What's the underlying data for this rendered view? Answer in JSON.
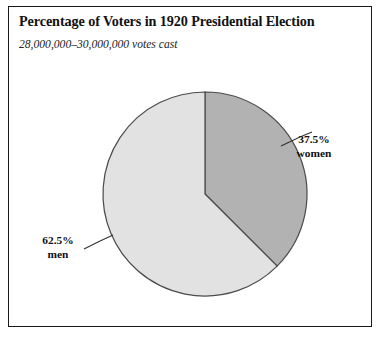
{
  "figure": {
    "title": "Percentage of Voters in 1920 Presidential Election",
    "subtitle": "28,000,000–30,000,000 votes cast",
    "frame_color": "#1a1a1a",
    "background_color": "#ffffff"
  },
  "labels": {
    "women": {
      "percent": "37.5%",
      "name": "women"
    },
    "men": {
      "percent": "62.5%",
      "name": "men"
    }
  },
  "chart_data": {
    "type": "pie",
    "title": "Percentage of Voters in 1920 Presidential Election",
    "subtitle": "28,000,000–30,000,000 votes cast",
    "categories": [
      "women",
      "men"
    ],
    "values": [
      37.5,
      62.5
    ],
    "value_labels": [
      "37.5%",
      "62.5%"
    ],
    "units": "percent",
    "total": 100,
    "start_angle_deg": 0,
    "direction": "clockwise",
    "slice_colors": [
      "#b2b2b2",
      "#e2e2e2"
    ],
    "slice_edge_color": "#4a4a4a",
    "legend": "none",
    "labels_position": "outside-with-leader-lines",
    "grid": false,
    "annotations": [
      "28,000,000–30,000,000 votes cast"
    ]
  }
}
